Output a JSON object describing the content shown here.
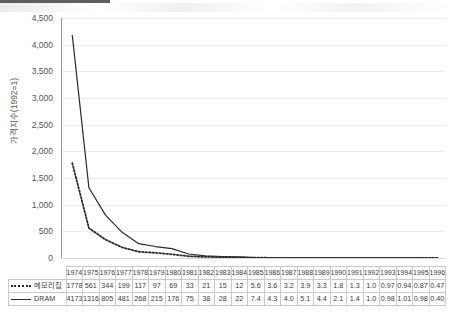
{
  "chart_data": {
    "type": "line",
    "title": "",
    "xlabel": "",
    "ylabel": "가격지수(1992=1)",
    "ylim": [
      0,
      4500
    ],
    "ytick_labels": [
      "4,500",
      "4,000",
      "3,500",
      "3,000",
      "2,500",
      "2,000",
      "1,500",
      "1,000",
      "500",
      "0"
    ],
    "ytick_values": [
      4500,
      4000,
      3500,
      3000,
      2500,
      2000,
      1500,
      1000,
      500,
      0
    ],
    "grid": true,
    "legend_position": "table-left",
    "categories": [
      "1974",
      "1975",
      "1976",
      "1977",
      "1978",
      "1979",
      "1980",
      "1981",
      "1982",
      "1983",
      "1984",
      "1985",
      "1986",
      "1987",
      "1988",
      "1989",
      "1990",
      "1991",
      "1992",
      "1993",
      "1994",
      "1995",
      "1996"
    ],
    "series": [
      {
        "name": "메모리칩",
        "style": "dotted",
        "color": "#2b2b2b",
        "values": [
          1778,
          561,
          344,
          199,
          117,
          97,
          69,
          33,
          21,
          15,
          12,
          5.6,
          3.6,
          3.2,
          3.9,
          3.3,
          1.8,
          1.3,
          1.0,
          0.97,
          0.94,
          0.87,
          0.47
        ],
        "value_labels": [
          "1778",
          "561",
          "344",
          "199",
          "117",
          "97",
          "69",
          "33",
          "21",
          "15",
          "12",
          "5.6",
          "3.6",
          "3.2",
          "3.9",
          "3.3",
          "1.8",
          "1.3",
          "1.0",
          "0.97",
          "0.94",
          "0.87",
          "0.47"
        ]
      },
      {
        "name": "DRAM",
        "style": "solid",
        "color": "#2b2b2b",
        "values": [
          4173,
          1316,
          805,
          481,
          268,
          215,
          176,
          75,
          38,
          28,
          22,
          7.4,
          4.3,
          4.0,
          5.1,
          4.4,
          2.1,
          1.4,
          1.0,
          0.98,
          1.01,
          0.98,
          0.4
        ],
        "value_labels": [
          "4173",
          "1316",
          "805",
          "481",
          "268",
          "215",
          "176",
          "75",
          "38",
          "28",
          "22",
          "7.4",
          "4.3",
          "4.0",
          "5.1",
          "4.4",
          "2.1",
          "1.4",
          "1.0",
          "0.98",
          "1.01",
          "0.98",
          "0.40"
        ]
      }
    ]
  },
  "table": {
    "corner_label": "",
    "row_labels": [
      "메모리칩",
      "DRAM"
    ]
  }
}
